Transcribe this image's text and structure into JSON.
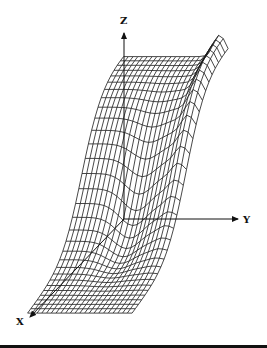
{
  "figure": {
    "type": "3d-wireframe-surface",
    "axes": {
      "x_label": "X",
      "y_label": "Y",
      "z_label": "Z"
    },
    "colors": {
      "mesh": "#1a1a1a",
      "axis": "#111111",
      "background": "#ffffff"
    },
    "mesh": {
      "rows": 30,
      "cols": 22
    }
  }
}
